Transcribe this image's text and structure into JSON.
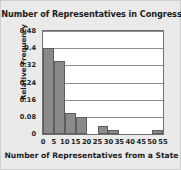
{
  "chart_data": {
    "type": "bar",
    "title": "Number of Representatives in Congress",
    "xlabel": "Number of Representatives from a State",
    "ylabel": "Relative Frequency",
    "xtick_labels": [
      "0",
      "5",
      "10",
      "15",
      "20",
      "25",
      "30",
      "35",
      "40",
      "45",
      "50",
      "55"
    ],
    "xtick_values": [
      0,
      5,
      10,
      15,
      20,
      25,
      30,
      35,
      40,
      45,
      50,
      55
    ],
    "ytick_labels": [
      "0",
      "0.08",
      "0.16",
      "0.24",
      "0.32",
      "0.4",
      "0.48"
    ],
    "ytick_values": [
      0,
      0.08,
      0.16,
      0.24,
      0.32,
      0.4,
      0.48
    ],
    "xlim": [
      0,
      55
    ],
    "ylim": [
      0,
      0.48
    ],
    "grid": "horizontal",
    "legend": "none",
    "bin_width": 5,
    "bin_edges": [
      0,
      5,
      10,
      15,
      20,
      25,
      30,
      35,
      40,
      45,
      50,
      55
    ],
    "categories": [
      "0-5",
      "5-10",
      "10-15",
      "15-20",
      "20-25",
      "25-30",
      "30-35",
      "35-40",
      "40-45",
      "45-50",
      "50-55"
    ],
    "values": [
      0.4,
      0.34,
      0.1,
      0.077,
      0.0,
      0.036,
      0.018,
      0.0,
      0.0,
      0.0,
      0.018
    ],
    "bar_color": "#8a8a8a",
    "bar_edge_color": "#5d5d5d",
    "plot_background": "#ffffff",
    "figure_background": "#eaeaea"
  }
}
